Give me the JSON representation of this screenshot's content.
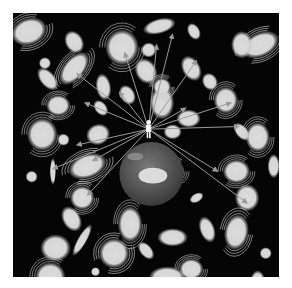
{
  "illustration": {
    "subject": "observer standing on Earth with arrows pointing to surrounding galaxies",
    "background_color": "#050505",
    "galaxy_color": "#d8d8d8",
    "arrow_color": "#9a9a9a",
    "earth_color": "#5a5a5a",
    "observer_color": "#ffffff",
    "galaxies": [
      {
        "kind": "spiral",
        "x": 0.06,
        "y": 0.07,
        "rx": 0.06,
        "ry": 0.045,
        "rot": -20
      },
      {
        "kind": "elliptical",
        "x": 0.23,
        "y": 0.11,
        "rx": 0.03,
        "ry": 0.04,
        "rot": -30
      },
      {
        "kind": "spiral",
        "x": 0.41,
        "y": 0.13,
        "rx": 0.055,
        "ry": 0.06,
        "rot": 0
      },
      {
        "kind": "elliptical",
        "x": 0.55,
        "y": 0.05,
        "rx": 0.055,
        "ry": 0.025,
        "rot": -15
      },
      {
        "kind": "elliptical",
        "x": 0.68,
        "y": 0.07,
        "rx": 0.02,
        "ry": 0.03,
        "rot": -30
      },
      {
        "kind": "spiral",
        "x": 0.93,
        "y": 0.12,
        "rx": 0.065,
        "ry": 0.04,
        "rot": -25
      },
      {
        "kind": "elliptical",
        "x": 0.5,
        "y": 0.22,
        "rx": 0.035,
        "ry": 0.045,
        "rot": -30
      },
      {
        "kind": "elliptical",
        "x": 0.56,
        "y": 0.34,
        "rx": 0.04,
        "ry": 0.055,
        "rot": 0
      },
      {
        "kind": "spiral",
        "x": 0.23,
        "y": 0.21,
        "rx": 0.065,
        "ry": 0.035,
        "rot": -50
      },
      {
        "kind": "elliptical",
        "x": 0.12,
        "y": 0.19,
        "rx": 0.02,
        "ry": 0.02,
        "rot": 0
      },
      {
        "kind": "elliptical",
        "x": 0.51,
        "y": 0.14,
        "rx": 0.025,
        "ry": 0.025,
        "rot": 0
      },
      {
        "kind": "elliptical",
        "x": 0.86,
        "y": 0.12,
        "rx": 0.035,
        "ry": 0.045,
        "rot": 0
      },
      {
        "kind": "elliptical",
        "x": 0.67,
        "y": 0.21,
        "rx": 0.03,
        "ry": 0.045,
        "rot": -30
      },
      {
        "kind": "elliptical",
        "x": 0.13,
        "y": 0.25,
        "rx": 0.025,
        "ry": 0.045,
        "rot": -40
      },
      {
        "kind": "elliptical",
        "x": 0.34,
        "y": 0.28,
        "rx": 0.025,
        "ry": 0.045,
        "rot": -10
      },
      {
        "kind": "elliptical",
        "x": 0.66,
        "y": 0.4,
        "rx": 0.04,
        "ry": 0.03,
        "rot": 0
      },
      {
        "kind": "spiral",
        "x": 0.8,
        "y": 0.33,
        "rx": 0.04,
        "ry": 0.045,
        "rot": 0
      },
      {
        "kind": "elliptical",
        "x": 0.86,
        "y": 0.45,
        "rx": 0.02,
        "ry": 0.035,
        "rot": -40
      },
      {
        "kind": "spiral",
        "x": 0.56,
        "y": 0.28,
        "rx": 0.03,
        "ry": 0.03,
        "rot": 0
      },
      {
        "kind": "elliptical",
        "x": 0.43,
        "y": 0.31,
        "rx": 0.025,
        "ry": 0.035,
        "rot": -30
      },
      {
        "kind": "elliptical",
        "x": 0.74,
        "y": 0.26,
        "rx": 0.025,
        "ry": 0.03,
        "rot": -30
      },
      {
        "kind": "spiral",
        "x": 0.17,
        "y": 0.35,
        "rx": 0.04,
        "ry": 0.035,
        "rot": 0
      },
      {
        "kind": "elliptical",
        "x": 0.33,
        "y": 0.36,
        "rx": 0.02,
        "ry": 0.03,
        "rot": -40
      },
      {
        "kind": "elliptical",
        "x": 0.6,
        "y": 0.45,
        "rx": 0.03,
        "ry": 0.025,
        "rot": 0
      },
      {
        "kind": "spiral",
        "x": 0.11,
        "y": 0.46,
        "rx": 0.05,
        "ry": 0.055,
        "rot": 0
      },
      {
        "kind": "elliptical",
        "x": 0.19,
        "y": 0.48,
        "rx": 0.02,
        "ry": 0.02,
        "rot": 0
      },
      {
        "kind": "elliptical",
        "x": 0.32,
        "y": 0.46,
        "rx": 0.04,
        "ry": 0.035,
        "rot": -20
      },
      {
        "kind": "spiral",
        "x": 0.92,
        "y": 0.47,
        "rx": 0.04,
        "ry": 0.05,
        "rot": 0
      },
      {
        "kind": "elliptical",
        "x": 0.15,
        "y": 0.6,
        "rx": 0.01,
        "ry": 0.045,
        "rot": 0
      },
      {
        "kind": "spiral",
        "x": 0.28,
        "y": 0.58,
        "rx": 0.065,
        "ry": 0.04,
        "rot": -20
      },
      {
        "kind": "spiral",
        "x": 0.26,
        "y": 0.7,
        "rx": 0.04,
        "ry": 0.04,
        "rot": 0
      },
      {
        "kind": "elliptical",
        "x": 0.07,
        "y": 0.62,
        "rx": 0.02,
        "ry": 0.02,
        "rot": 0
      },
      {
        "kind": "elliptical",
        "x": 0.45,
        "y": 0.6,
        "rx": 0.015,
        "ry": 0.02,
        "rot": 0
      },
      {
        "kind": "spiral",
        "x": 0.6,
        "y": 0.6,
        "rx": 0.04,
        "ry": 0.035,
        "rot": 0
      },
      {
        "kind": "spiral",
        "x": 0.84,
        "y": 0.6,
        "rx": 0.045,
        "ry": 0.04,
        "rot": 0
      },
      {
        "kind": "elliptical",
        "x": 0.98,
        "y": 0.58,
        "rx": 0.02,
        "ry": 0.04,
        "rot": 0
      },
      {
        "kind": "spiral",
        "x": 0.44,
        "y": 0.8,
        "rx": 0.04,
        "ry": 0.06,
        "rot": 0
      },
      {
        "kind": "elliptical",
        "x": 0.22,
        "y": 0.78,
        "rx": 0.03,
        "ry": 0.045,
        "rot": -30
      },
      {
        "kind": "elliptical",
        "x": 0.69,
        "y": 0.7,
        "rx": 0.025,
        "ry": 0.015,
        "rot": -30
      },
      {
        "kind": "elliptical",
        "x": 0.88,
        "y": 0.7,
        "rx": 0.04,
        "ry": 0.045,
        "rot": 0
      },
      {
        "kind": "elliptical",
        "x": 0.26,
        "y": 0.86,
        "rx": 0.015,
        "ry": 0.06,
        "rot": 30
      },
      {
        "kind": "elliptical",
        "x": 0.16,
        "y": 0.89,
        "rx": 0.05,
        "ry": 0.045,
        "rot": 0
      },
      {
        "kind": "spiral",
        "x": 0.38,
        "y": 0.91,
        "rx": 0.05,
        "ry": 0.05,
        "rot": -20
      },
      {
        "kind": "elliptical",
        "x": 0.5,
        "y": 0.9,
        "rx": 0.02,
        "ry": 0.035,
        "rot": -40
      },
      {
        "kind": "elliptical",
        "x": 0.6,
        "y": 0.85,
        "rx": 0.05,
        "ry": 0.03,
        "rot": 0
      },
      {
        "kind": "elliptical",
        "x": 0.73,
        "y": 0.82,
        "rx": 0.025,
        "ry": 0.045,
        "rot": -20
      },
      {
        "kind": "spiral",
        "x": 0.84,
        "y": 0.83,
        "rx": 0.04,
        "ry": 0.06,
        "rot": 10
      },
      {
        "kind": "elliptical",
        "x": 0.95,
        "y": 0.91,
        "rx": 0.02,
        "ry": 0.02,
        "rot": 0
      },
      {
        "kind": "spiral",
        "x": 0.14,
        "y": 1.0,
        "rx": 0.05,
        "ry": 0.05,
        "rot": 0
      },
      {
        "kind": "elliptical",
        "x": 0.58,
        "y": 1.0,
        "rx": 0.06,
        "ry": 0.035,
        "rot": 0
      },
      {
        "kind": "spiral",
        "x": 0.67,
        "y": 0.97,
        "rx": 0.04,
        "ry": 0.035,
        "rot": 0
      },
      {
        "kind": "elliptical",
        "x": 0.31,
        "y": 0.98,
        "rx": 0.015,
        "ry": 0.015,
        "rot": 0
      },
      {
        "kind": "elliptical",
        "x": 0.92,
        "y": 1.02,
        "rx": 0.025,
        "ry": 0.04,
        "rot": 0
      }
    ],
    "observer": {
      "x": 0.51,
      "y": 0.44
    },
    "earth": {
      "x": 0.52,
      "y": 0.61,
      "r": 0.12
    },
    "arrow_targets": [
      {
        "x": 0.24,
        "y": 0.23
      },
      {
        "x": 0.42,
        "y": 0.15
      },
      {
        "x": 0.54,
        "y": 0.12
      },
      {
        "x": 0.6,
        "y": 0.08
      },
      {
        "x": 0.4,
        "y": 0.3
      },
      {
        "x": 0.27,
        "y": 0.34
      },
      {
        "x": 0.69,
        "y": 0.18
      },
      {
        "x": 0.65,
        "y": 0.36
      },
      {
        "x": 0.82,
        "y": 0.34
      },
      {
        "x": 0.85,
        "y": 0.43
      },
      {
        "x": 0.15,
        "y": 0.59
      },
      {
        "x": 0.3,
        "y": 0.56
      },
      {
        "x": 0.28,
        "y": 0.69
      },
      {
        "x": 0.24,
        "y": 0.5
      },
      {
        "x": 0.77,
        "y": 0.6
      },
      {
        "x": 0.88,
        "y": 0.72
      }
    ]
  }
}
